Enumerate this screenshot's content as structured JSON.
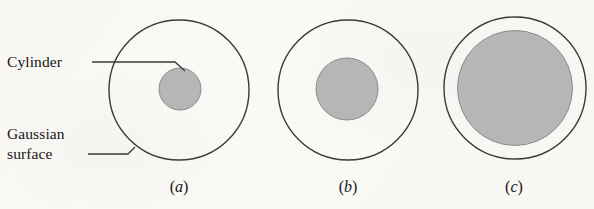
{
  "figure": {
    "background_color": "#faf9f6",
    "stroke_color": "#3a3a3a",
    "fill_gray": "#b6b6b6",
    "text_color": "#161616",
    "labels": {
      "cylinder": "Cylinder",
      "gaussian_line1": "Gaussian",
      "gaussian_line2": "surface"
    },
    "captions": {
      "a_open": "(",
      "a_letter": "a",
      "a_close": ")",
      "b_open": "(",
      "b_letter": "b",
      "b_close": ")",
      "c_open": "(",
      "c_letter": "c",
      "c_close": ")"
    },
    "panels": [
      {
        "id": "a",
        "caption": "(a)",
        "gaussian_surface": {
          "cx": 179,
          "cy": 90,
          "r": 70
        },
        "cylinder": {
          "cx": 180,
          "cy": 89,
          "r": 21
        }
      },
      {
        "id": "b",
        "caption": "(b)",
        "gaussian_surface": {
          "cx": 348,
          "cy": 90,
          "r": 70
        },
        "cylinder": {
          "cx": 347,
          "cy": 89,
          "r": 31
        }
      },
      {
        "id": "c",
        "caption": "(c)",
        "gaussian_surface": {
          "cx": 515,
          "cy": 88,
          "r": 71
        },
        "cylinder": {
          "cx": 515,
          "cy": 88,
          "r": 57.5
        }
      }
    ],
    "leader_lines": [
      {
        "name": "cylinder-leader",
        "points": "92,62 175,62 185,71"
      },
      {
        "name": "gaussian-leader",
        "points": "88,154 128,154 135,147"
      }
    ]
  }
}
